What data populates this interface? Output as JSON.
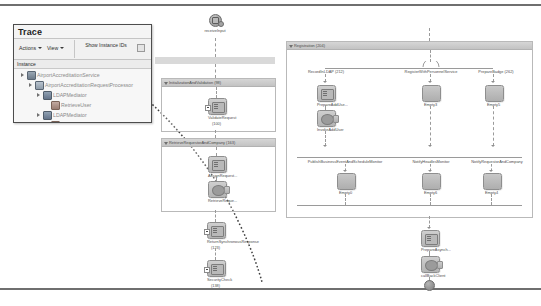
{
  "window": {
    "background_color": "#ffffff"
  },
  "trace_panel": {
    "title": "Trace",
    "toolbar": {
      "actions_label": "Actions",
      "view_label": "View",
      "show_instance_ids_label": "Show Instance IDs",
      "show_instance_ids_checked": false
    },
    "column_header": "Instance",
    "tree": [
      {
        "label": "AirportAccreditationService",
        "depth": 0,
        "icon": "service-icon",
        "expanded": true
      },
      {
        "label": "AirportAccreditationRequestProcessor",
        "depth": 1,
        "icon": "process-icon",
        "expanded": true
      },
      {
        "label": "LDAPMediator",
        "depth": 2,
        "icon": "mediator-icon",
        "expanded": true
      },
      {
        "label": "RetrieveUser",
        "depth": 3,
        "icon": "operation-icon",
        "expanded": false
      },
      {
        "label": "LDAPMediator",
        "depth": 2,
        "icon": "mediator-icon",
        "expanded": true
      },
      {
        "label": "AddUser",
        "depth": 3,
        "icon": "operation-icon",
        "expanded": false
      }
    ]
  },
  "flow": {
    "start_event": {
      "label": "receiveInput",
      "icon": "receive-event-icon"
    },
    "end_event": {
      "label": "",
      "icon": "end-event-icon"
    },
    "left_column": {
      "scopes": [
        {
          "name": "InitializationAndValidation (98)",
          "expanded": true,
          "nodes": [
            {
              "label": "ValidateRequest",
              "count": "(100)",
              "icon": "assign-activity-icon",
              "expandable": true
            }
          ]
        },
        {
          "name": "RetrieveRequestorAndCompany (163)",
          "expanded": true,
          "nodes": [
            {
              "label": "AssignRequest...",
              "count": "",
              "icon": "assign-activity-icon",
              "expandable": false
            },
            {
              "label": "RetrieveReque...",
              "count": "",
              "icon": "invoke-activity-icon",
              "expandable": false
            }
          ]
        }
      ],
      "trailing_nodes": [
        {
          "label": "ReturnSynchronousResponse",
          "count": "(123)",
          "icon": "reply-activity-icon",
          "expandable": true
        },
        {
          "label": "SecurityCheck",
          "count": "(138)",
          "icon": "assign-activity-icon",
          "expandable": true
        }
      ]
    },
    "right_scope": {
      "name": "Registration (204)",
      "expanded": true,
      "branch_row_1": [
        {
          "header": "RecordInLDAP (212)",
          "nodes": [
            {
              "label": "PrepareAddUse...",
              "icon": "assign-activity-icon"
            },
            {
              "label": "InvokeAddUser",
              "icon": "invoke-activity-icon"
            }
          ]
        },
        {
          "header": "RegisterWithPersonnelService",
          "nodes": [
            {
              "label": "Empty3",
              "icon": "empty-activity-icon"
            }
          ]
        },
        {
          "header": "PrepareBadge (262)",
          "nodes": [
            {
              "label": "Empty5",
              "icon": "empty-activity-icon"
            }
          ]
        }
      ],
      "branch_row_2": [
        {
          "header": "PublishBusinessEventAndScheduleMonitor",
          "nodes": [
            {
              "label": "Empty0",
              "icon": "empty-activity-icon"
            }
          ]
        },
        {
          "header": "NotifyHeadlesMonitor",
          "nodes": [
            {
              "label": "Empty6",
              "icon": "empty-activity-icon"
            }
          ]
        },
        {
          "header": "NotifyRequestorAndCompany",
          "nodes": [
            {
              "label": "Empty4",
              "icon": "empty-activity-icon"
            }
          ]
        }
      ],
      "tail_nodes": [
        {
          "label": "PrepareAsynch...",
          "icon": "assign-activity-icon"
        },
        {
          "label": "callBackClient",
          "icon": "invoke-activity-icon"
        }
      ]
    }
  }
}
